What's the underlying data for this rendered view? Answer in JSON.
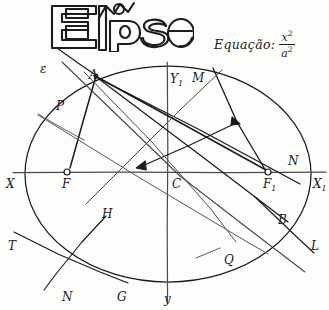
{
  "page": {
    "title_text": "Elipse",
    "background_color": "#fdfdfb",
    "ink_color": "#1a1a1a",
    "width": 329,
    "height": 310
  },
  "equation": {
    "label": "Equação:",
    "numerator": "x",
    "numerator_exponent": "2",
    "denominator": "a",
    "denominator_exponent": "2"
  },
  "figure": {
    "kind": "hand-drawn-ellipse-geometry",
    "ellipse": {
      "center_label": "C",
      "cx": 168,
      "cy": 174,
      "rx": 143,
      "ry": 108
    },
    "axes": {
      "horizontal_left_label": "X",
      "horizontal_right_label": "X",
      "horizontal_right_subscript": "1",
      "vertical_top_label": "Y",
      "vertical_top_subscript": "1",
      "vertical_bottom_label": "y"
    },
    "foci": [
      {
        "label": "F",
        "subscript": "",
        "x": 67,
        "y": 172
      },
      {
        "label": "F",
        "subscript": "1",
        "x": 268,
        "y": 172
      }
    ]
  },
  "labels": [
    {
      "name": "label-epsilon",
      "text": "ε",
      "sub": "",
      "x": 40,
      "y": 63
    },
    {
      "name": "label-A",
      "text": "A",
      "sub": "",
      "x": 89,
      "y": 69
    },
    {
      "name": "label-P",
      "text": "P",
      "sub": "",
      "x": 56,
      "y": 100
    },
    {
      "name": "label-Y1",
      "text": "Y",
      "sub": "1",
      "x": 170,
      "y": 73
    },
    {
      "name": "label-M",
      "text": "M",
      "sub": "",
      "x": 192,
      "y": 72
    },
    {
      "name": "label-N-right",
      "text": "N",
      "sub": "",
      "x": 288,
      "y": 155
    },
    {
      "name": "label-X-left",
      "text": "X",
      "sub": "",
      "x": 6,
      "y": 178
    },
    {
      "name": "label-F",
      "text": "F",
      "sub": "",
      "x": 62,
      "y": 178
    },
    {
      "name": "label-C",
      "text": "C",
      "sub": "",
      "x": 172,
      "y": 178
    },
    {
      "name": "label-F1",
      "text": "F",
      "sub": "1",
      "x": 263,
      "y": 178
    },
    {
      "name": "label-X1",
      "text": "X",
      "sub": "1",
      "x": 313,
      "y": 178
    },
    {
      "name": "label-H",
      "text": "H",
      "sub": "",
      "x": 102,
      "y": 208
    },
    {
      "name": "label-B",
      "text": "B",
      "sub": "",
      "x": 278,
      "y": 214
    },
    {
      "name": "label-T",
      "text": "T",
      "sub": "",
      "x": 8,
      "y": 240
    },
    {
      "name": "label-L",
      "text": "L",
      "sub": "",
      "x": 311,
      "y": 240
    },
    {
      "name": "label-Q",
      "text": "Q",
      "sub": "",
      "x": 224,
      "y": 254
    },
    {
      "name": "label-N-bottom",
      "text": "N",
      "sub": "",
      "x": 62,
      "y": 291
    },
    {
      "name": "label-G",
      "text": "G",
      "sub": "",
      "x": 117,
      "y": 291
    },
    {
      "name": "label-y",
      "text": "y",
      "sub": "",
      "x": 164,
      "y": 293
    }
  ]
}
